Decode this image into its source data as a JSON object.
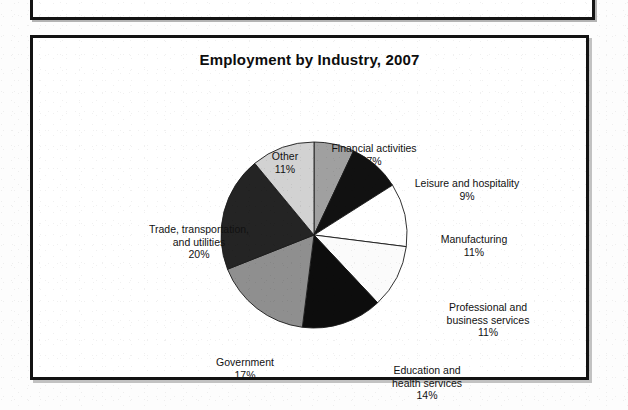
{
  "figure": {
    "title": "Employment by Industry, 2007"
  },
  "chart_data": {
    "type": "pie",
    "title": "Employment by Industry, 2007",
    "xlabel": "",
    "ylabel": "",
    "legend_position": "none",
    "grid": false,
    "units": "percent",
    "start_angle_deg": 0,
    "direction": "clockwise",
    "categories": [
      "Financial activities",
      "Leisure and hospitality",
      "Manufacturing",
      "Professional and business services",
      "Education and health services",
      "Government",
      "Trade, transportation, and utilities",
      "Other"
    ],
    "values": [
      7,
      9,
      11,
      11,
      14,
      17,
      20,
      11
    ],
    "slices": [
      {
        "label": "Financial activities",
        "label_lines": [
          "Financial activities"
        ],
        "value": 7,
        "value_text": "7%",
        "color": "#a0a0a0"
      },
      {
        "label": "Leisure and hospitality",
        "label_lines": [
          "Leisure and hospitality"
        ],
        "value": 9,
        "value_text": "9%",
        "color": "#111111"
      },
      {
        "label": "Manufacturing",
        "label_lines": [
          "Manufacturing"
        ],
        "value": 11,
        "value_text": "11%",
        "color": "#ffffff"
      },
      {
        "label": "Professional and business services",
        "label_lines": [
          "Professional and",
          "business services"
        ],
        "value": 11,
        "value_text": "11%",
        "color": "#fbfbfb"
      },
      {
        "label": "Education and health services",
        "label_lines": [
          "Education and",
          "health services"
        ],
        "value": 14,
        "value_text": "14%",
        "color": "#0d0d0d"
      },
      {
        "label": "Government",
        "label_lines": [
          "Government"
        ],
        "value": 17,
        "value_text": "17%",
        "color": "#8f8f8f"
      },
      {
        "label": "Trade, transportation, and utilities",
        "label_lines": [
          "Trade, transportation,",
          "and utilities"
        ],
        "value": 20,
        "value_text": "20%",
        "color": "#242424"
      },
      {
        "label": "Other",
        "label_lines": [
          "Other"
        ],
        "value": 11,
        "value_text": "11%",
        "color": "#d2d2d2"
      }
    ]
  },
  "labels": {
    "other": {
      "name": "Other",
      "value": "11%"
    },
    "financial": {
      "name": "Financial activities",
      "value": "7%"
    },
    "leisure": {
      "name": "Leisure and hospitality",
      "value": "9%"
    },
    "manufacturing": {
      "name": "Manufacturing",
      "value": "11%"
    },
    "professional": {
      "line1": "Professional and",
      "line2": "business services",
      "value": "11%"
    },
    "education": {
      "line1": "Education and",
      "line2": "health services",
      "value": "14%"
    },
    "government": {
      "name": "Government",
      "value": "17%"
    },
    "trade": {
      "line1": "Trade, transportation,",
      "line2": "and utilities",
      "value": "20%"
    }
  }
}
